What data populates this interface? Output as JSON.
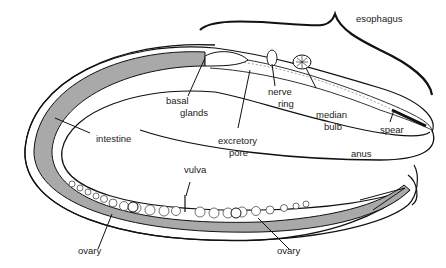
{
  "diagram": {
    "colors": {
      "line": "#111111",
      "fill_gray": "#a9a9a9",
      "background": "#ffffff"
    },
    "labels": {
      "esophagus": "esophagus",
      "basal_glands_1": "basal",
      "basal_glands_2": "glands",
      "nerve_ring_1": "nerve",
      "nerve_ring_2": "ring",
      "median_bulb_1": "median",
      "median_bulb_2": "bulb",
      "spear": "spear",
      "excretory_pore_1": "excretory",
      "excretory_pore_2": "pore",
      "intestine": "intestine",
      "anus": "anus",
      "vulva": "vulva",
      "ovary_left": "ovary",
      "ovary_right": "ovary"
    }
  }
}
